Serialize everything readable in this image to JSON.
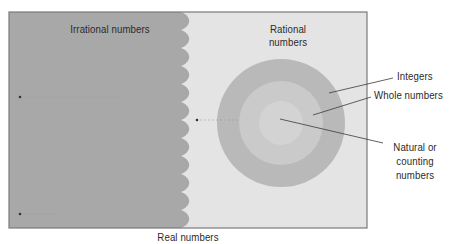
{
  "diagram": {
    "title": "Real numbers",
    "regions": {
      "irrational": {
        "label": "Irrational numbers",
        "fill": "#a8a8a8"
      },
      "rational": {
        "label_line1": "Rational",
        "label_line2": "numbers",
        "fill": "#e4e4e4"
      }
    },
    "rings": [
      {
        "name": "Integers",
        "label": "Integers",
        "fill": "#b9b9b9",
        "radius": 64
      },
      {
        "name": "Whole numbers",
        "label": "Whole numbers",
        "fill": "#cacaca",
        "radius": 42
      },
      {
        "name": "Natural or counting numbers",
        "label_line1": "Natural or",
        "label_line2": "counting",
        "label_line3": "numbers",
        "fill": "#d3d3d3",
        "radius": 22
      }
    ],
    "colors": {
      "border": "#7a7a7a",
      "leader_line": "#3a3a3a",
      "text": "#2b2b2b"
    }
  }
}
